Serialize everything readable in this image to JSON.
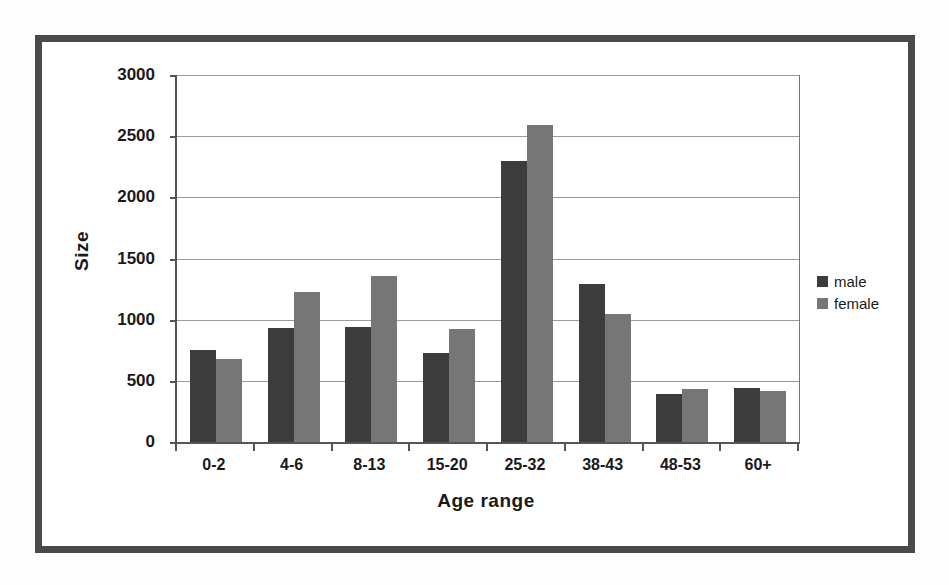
{
  "chart_data": {
    "type": "bar",
    "title": "",
    "xlabel": "Age range",
    "ylabel": "Size",
    "categories": [
      "0-2",
      "4-6",
      "8-13",
      "15-20",
      "25-32",
      "38-43",
      "48-53",
      "60+"
    ],
    "series": [
      {
        "name": "male",
        "color": "#3c3c3c",
        "values": [
          750,
          930,
          940,
          730,
          2300,
          1290,
          390,
          440
        ]
      },
      {
        "name": "female",
        "color": "#767676",
        "values": [
          680,
          1230,
          1360,
          920,
          2590,
          1050,
          430,
          420
        ]
      }
    ],
    "ylim": [
      0,
      3000
    ],
    "yticks": [
      0,
      500,
      1000,
      1500,
      2000,
      2500,
      3000
    ],
    "ytick_labels": [
      "0",
      "500",
      "1000",
      "1500",
      "2000",
      "2500",
      "3000"
    ],
    "grid": true,
    "legend_position": "right",
    "legend_entries": [
      "male",
      "female"
    ]
  },
  "figure": {
    "frame_color": "#4a4a4a",
    "background": "#ffffff",
    "plot_background": "#ffffff",
    "gridline_color": "#9a9a9a",
    "axis_color": "#555555"
  }
}
